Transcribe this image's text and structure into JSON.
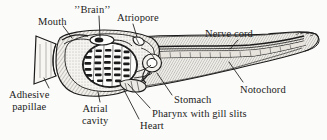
{
  "figure": {
    "style": "line-drawing-with-hatching",
    "ink_color": "#1b1b1b",
    "paper_color": "#fbfbf9"
  },
  "labels": {
    "mouth": "Mouth",
    "brain": "’’Brain’’",
    "atriopore": "Atriopore",
    "nerve_cord": "Nerve cord",
    "notochord": "Notochord",
    "stomach": "Stomach",
    "pharynx": "Pharynx with gill slits",
    "heart": "Heart",
    "adhesive_papillae": "Adhesive\npapillae",
    "atrial_cavity": "Atrial\ncavity"
  }
}
